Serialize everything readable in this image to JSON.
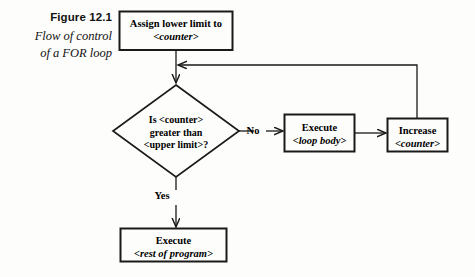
{
  "figure": {
    "number_label": "Figure 12.1",
    "caption_line1": "Flow of control",
    "caption_line2": "of a FOR loop"
  },
  "diagram": {
    "type": "flowchart",
    "nodes": [
      {
        "id": "assign",
        "shape": "rectangle",
        "line1": "Assign lower limit to",
        "line2": "<counter>",
        "line2_style": "italic"
      },
      {
        "id": "decision",
        "shape": "diamond",
        "line1": "Is <counter>",
        "line2": "greater than",
        "line3": "<upper limit>?"
      },
      {
        "id": "loop-body",
        "shape": "rectangle",
        "line1": "Execute",
        "line2": "<loop body>",
        "line2_style": "italic"
      },
      {
        "id": "increase",
        "shape": "rectangle",
        "line1": "Increase",
        "line2": "<counter>",
        "line2_style": "italic"
      },
      {
        "id": "rest-of-program",
        "shape": "rectangle",
        "line1": "Execute",
        "line2": "<rest of program>",
        "line2_style": "italic"
      }
    ],
    "edge_labels": {
      "no": "No",
      "yes": "Yes"
    },
    "colors": {
      "stroke": "#1a1a1a",
      "text": "#000000",
      "background": "#fdfdfb"
    }
  }
}
